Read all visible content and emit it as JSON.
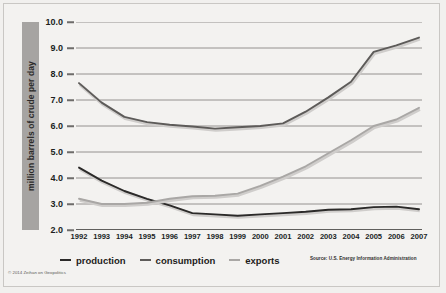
{
  "figure": {
    "y_axis_title": "million barrels of crude per day",
    "source_note": "Source: U.S. Energy Information Administration",
    "credit": "© 2014 Zeihan on Geopolitics"
  },
  "legend": {
    "items": [
      {
        "label": "production",
        "color": "#2b2a29"
      },
      {
        "label": "consumption",
        "color": "#5d5b59"
      },
      {
        "label": "exports",
        "color": "#a9a7a5"
      }
    ]
  },
  "chart_data": {
    "type": "line",
    "title": "",
    "xlabel": "",
    "ylabel": "million barrels of crude per day",
    "ylim": [
      2.0,
      10.0
    ],
    "yticks": [
      2.0,
      3.0,
      4.0,
      5.0,
      6.0,
      7.0,
      8.0,
      9.0,
      10.0
    ],
    "ytick_labels": [
      "2.0",
      "3.0",
      "4.0",
      "5.0",
      "6.0",
      "7.0",
      "8.0",
      "9.0",
      "10.0"
    ],
    "grid": true,
    "legend_position": "below",
    "categories": [
      "1992",
      "1993",
      "1994",
      "1995",
      "1996",
      "1997",
      "1998",
      "1999",
      "2000",
      "2001",
      "2002",
      "2003",
      "2004",
      "2005",
      "2006",
      "2007"
    ],
    "series": [
      {
        "name": "production",
        "color": "#2b2a29",
        "values": [
          4.4,
          3.9,
          3.5,
          3.2,
          2.95,
          2.65,
          2.6,
          2.55,
          2.6,
          2.65,
          2.7,
          2.78,
          2.8,
          2.88,
          2.9,
          2.8
        ]
      },
      {
        "name": "consumption",
        "color": "#5d5b59",
        "values": [
          7.65,
          6.9,
          6.35,
          6.15,
          6.05,
          5.98,
          5.9,
          5.95,
          6.0,
          6.1,
          6.55,
          7.1,
          7.7,
          8.85,
          9.1,
          9.4
        ]
      },
      {
        "name": "exports",
        "color": "#a9a7a5",
        "values": [
          3.2,
          3.0,
          3.0,
          3.05,
          3.2,
          3.3,
          3.32,
          3.4,
          3.7,
          4.05,
          4.45,
          4.95,
          5.45,
          6.0,
          6.25,
          6.7
        ]
      }
    ]
  }
}
